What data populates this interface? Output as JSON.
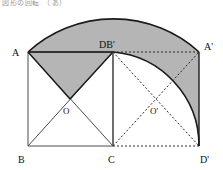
{
  "figure": {
    "title_strip": "図形の回転　（あ）（い）",
    "type": "geometry-diagram",
    "colors": {
      "shade": "#b5b5b5",
      "stroke": "#1a1a1a",
      "thin_stroke": "#555555",
      "background": "#ffffff"
    },
    "labels": {
      "a": "A",
      "db_prime": "DB'",
      "a_prime": "A'",
      "o": "O",
      "o_prime": "O'",
      "b": "B",
      "c": "C",
      "d_prime": "D'"
    },
    "points": {
      "A": {
        "x": 28,
        "y": 52
      },
      "B": {
        "x": 28,
        "y": 146
      },
      "C": {
        "x": 113,
        "y": 146
      },
      "D": {
        "x": 113,
        "y": 52
      },
      "O": {
        "x": 70,
        "y": 99
      },
      "Aprime": {
        "x": 199,
        "y": 52
      },
      "Dprime": {
        "x": 199,
        "y": 146
      },
      "Oprime": {
        "x": 156,
        "y": 99
      }
    },
    "arcs": {
      "outer": {
        "center": "C",
        "from": "A",
        "to": "Aprime",
        "radius": 127,
        "note": "arc traced by vertex A"
      },
      "inner": {
        "center": "C",
        "from": "D",
        "to": "Dprime",
        "radius": 94,
        "note": "arc traced by vertex D"
      }
    },
    "rotation_angle_deg": 90
  }
}
